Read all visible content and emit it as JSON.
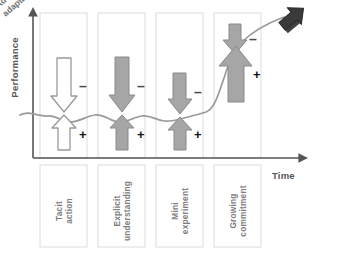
{
  "figure": {
    "type": "process-performance-diagram",
    "axes": {
      "y_label": "Performance",
      "x_label": "Time",
      "y_arrow": "up-arrow-icon",
      "x_arrow": "right-arrow-icon",
      "axis_color": "#555555",
      "origin": {
        "x": 33,
        "y": 158
      }
    },
    "curve": {
      "name": "performance-curve",
      "color": "#9a9a9a",
      "description": "wavy flat line through first three phases, steep rise in fourth phase, continues up-right"
    },
    "end_marker": {
      "label": "Adoption /\nadaptation",
      "label_line1": "Adoption /",
      "label_line2": "adaptation",
      "icon": "block-arrow-up-right-icon",
      "color": "#3a3a3a"
    },
    "phases": [
      {
        "id": "tacit-action",
        "label_line1": "Tacit",
        "label_line2": "action",
        "arrow_style": "outline",
        "arrow_fill": "#ffffff",
        "arrow_stroke": "#9a9a9a",
        "down_arrow": {
          "sign": "–",
          "size": "medium"
        },
        "up_arrow": {
          "sign": "+",
          "size": "small"
        }
      },
      {
        "id": "explicit-understanding",
        "label_line1": "Explicit",
        "label_line2": "understanding",
        "arrow_style": "filled",
        "arrow_fill": "#a6a6a6",
        "arrow_stroke": "#8a8a8a",
        "down_arrow": {
          "sign": "–",
          "size": "medium"
        },
        "up_arrow": {
          "sign": "+",
          "size": "small"
        }
      },
      {
        "id": "mini-experiment",
        "label_line1": "Mini",
        "label_line2": "experiment",
        "arrow_style": "filled",
        "arrow_fill": "#a6a6a6",
        "arrow_stroke": "#8a8a8a",
        "down_arrow": {
          "sign": "–",
          "size": "small"
        },
        "up_arrow": {
          "sign": "+",
          "size": "small"
        }
      },
      {
        "id": "growing-commitment",
        "label_line1": "Growing",
        "label_line2": "commitment",
        "arrow_style": "filled",
        "arrow_fill": "#a6a6a6",
        "arrow_stroke": "#8a8a8a",
        "down_arrow": {
          "sign": "–",
          "size": "small"
        },
        "up_arrow": {
          "sign": "+",
          "size": "large"
        }
      }
    ],
    "colors": {
      "panel_border": "#dcdcdc",
      "text_gray": "#7d7d7d",
      "arrow_gray": "#a6a6a6",
      "dark": "#3a3a3a"
    }
  }
}
